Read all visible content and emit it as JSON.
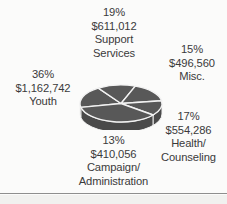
{
  "chart_data": {
    "type": "pie",
    "title": "",
    "subtitle": "",
    "xlabel": "",
    "ylabel": "",
    "legend_position": "none",
    "grid": false,
    "three_d": true,
    "value_prefix": "$",
    "total_value": "$3,234,656",
    "categories": [
      "Support Services",
      "Misc.",
      "Health/Counseling",
      "Campaign/Administration",
      "Youth"
    ],
    "values": [
      611012,
      496560,
      554286,
      410056,
      1162742
    ],
    "percentages": [
      19,
      15,
      17,
      13,
      36
    ],
    "colors": {
      "slice_fill": "#585858",
      "slice_edge": "#f2f2f2",
      "side_wall": "#4a4a4a",
      "text": "#3a3a3a",
      "background": "#fbfbfa",
      "rule": "#8e8e8e"
    },
    "slices": [
      {
        "name": "Support Services",
        "percent_label": "19%",
        "value_label": "$611,012",
        "label_lines": [
          "Support",
          "Services"
        ],
        "percent": 19,
        "value": 611012
      },
      {
        "name": "Misc.",
        "percent_label": "15%",
        "value_label": "$496,560",
        "label_lines": [
          "Misc."
        ],
        "percent": 15,
        "value": 496560
      },
      {
        "name": "Health/Counseling",
        "percent_label": "17%",
        "value_label": "$554,286",
        "label_lines": [
          "Health/",
          "Counseling"
        ],
        "percent": 17,
        "value": 554286
      },
      {
        "name": "Campaign/Administration",
        "percent_label": "13%",
        "value_label": "$410,056",
        "label_lines": [
          "Campaign/",
          "Administration"
        ],
        "percent": 13,
        "value": 410056
      },
      {
        "name": "Youth",
        "percent_label": "36%",
        "value_label": "$1,162,742",
        "label_lines": [
          "Youth"
        ],
        "percent": 36,
        "value": 1162742
      }
    ]
  },
  "labels": {
    "support": {
      "percent": "19%",
      "value": "$611,012",
      "name_line1": "Support",
      "name_line2": "Services"
    },
    "misc": {
      "percent": "15%",
      "value": "$496,560",
      "name_line1": "Misc."
    },
    "health": {
      "percent": "17%",
      "value": "$554,286",
      "name_line1": "Health/",
      "name_line2": "Counseling"
    },
    "campaign": {
      "percent": "13%",
      "value": "$410,056",
      "name_line1": "Campaign/",
      "name_line2": "Administration"
    },
    "youth": {
      "percent": "36%",
      "value": "$1,162,742",
      "name_line1": "Youth"
    }
  }
}
